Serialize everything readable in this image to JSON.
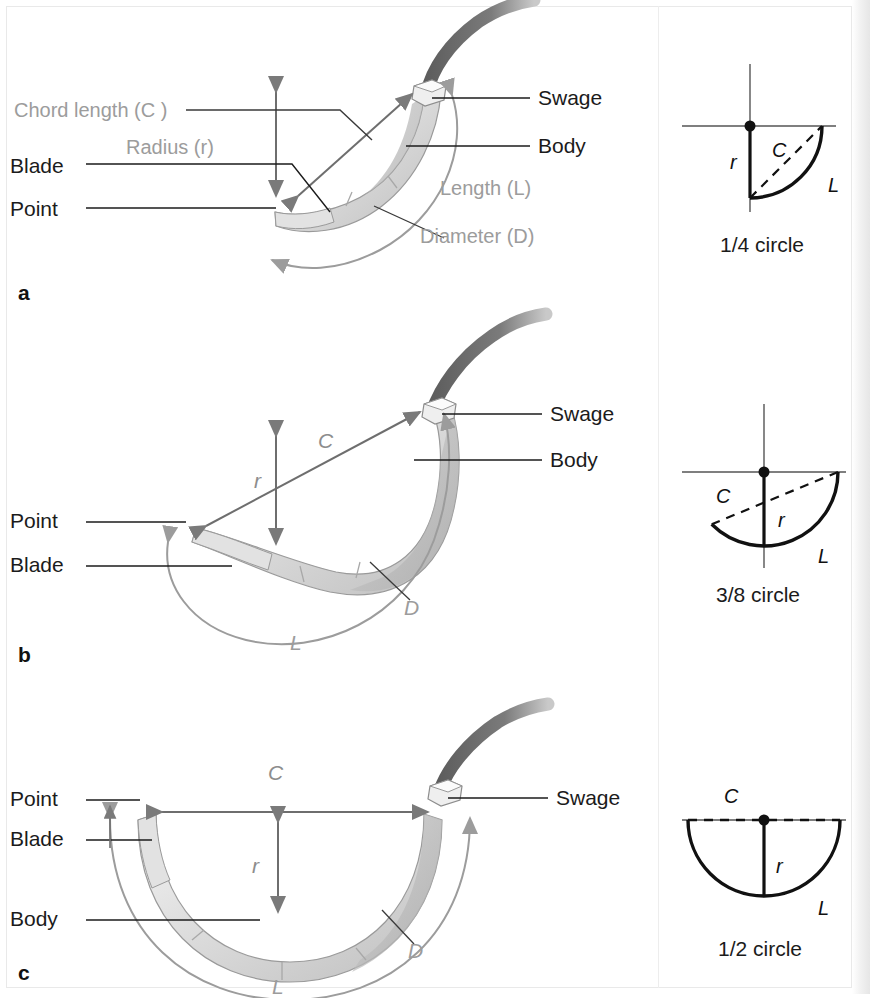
{
  "figure": {
    "accent_dark": "#1b1b1b",
    "accent_gray": "#9c9c9c",
    "needle_fill": "#d9d9d9",
    "thread_color": "#6a6a6a"
  },
  "panels": [
    {
      "letter": "a",
      "curvature": "1/4 circle",
      "labels": {
        "chord": "Chord length (C )",
        "radius": "Radius (r)",
        "blade": "Blade",
        "point": "Point",
        "swage": "Swage",
        "body": "Body",
        "length": "Length (L)",
        "diameter": "Diameter (D)"
      }
    },
    {
      "letter": "b",
      "curvature": "3/8 circle",
      "labels": {
        "chord": "C",
        "radius": "r",
        "point": "Point",
        "blade": "Blade",
        "swage": "Swage",
        "body": "Body",
        "length": "L",
        "diameter": "D"
      }
    },
    {
      "letter": "c",
      "curvature": "1/2 circle",
      "labels": {
        "chord": "C",
        "radius": "r",
        "point": "Point",
        "blade": "Blade",
        "body": "Body",
        "swage": "Swage",
        "length": "L",
        "diameter": "D"
      }
    }
  ],
  "circle_diagrams": [
    {
      "caption": "1/4 circle",
      "radius_label": "r",
      "chord_label": "C",
      "length_label": "L"
    },
    {
      "caption": "3/8 circle",
      "radius_label": "r",
      "chord_label": "C",
      "length_label": "L"
    },
    {
      "caption": "1/2 circle",
      "radius_label": "r",
      "chord_label": "C",
      "length_label": "L"
    }
  ]
}
